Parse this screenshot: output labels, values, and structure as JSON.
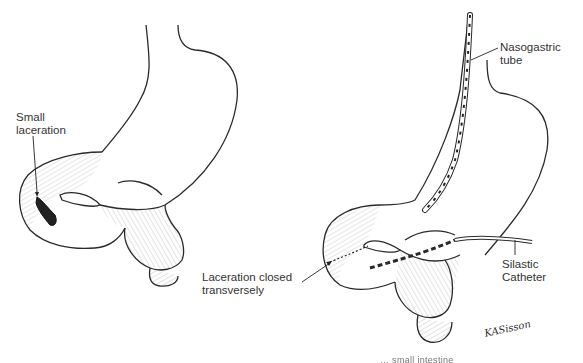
{
  "figure": {
    "type": "medical line illustration",
    "panels": [
      {
        "id": "before",
        "description": "Stomach and duodenum showing small laceration",
        "labels": {
          "laceration": "Small\nlaceration"
        }
      },
      {
        "id": "after",
        "description": "Repair with nasogastric tube and silastic catheter",
        "labels": {
          "nasogastric": "Nasogastric\ntube",
          "closed": "Laceration closed\ntransversely",
          "silastic": "Silastic\nCatheter"
        }
      }
    ],
    "labels_lines": {
      "small_1": "Small",
      "small_2": "laceration",
      "ng_1": "Nasogastric",
      "ng_2": "tube",
      "closed_1": "Laceration closed",
      "closed_2": "transversely",
      "silastic_1": "Silastic",
      "silastic_2": "Catheter"
    },
    "signature": "KASisson",
    "caption_fragment": "… small intestine"
  },
  "colors": {
    "ink": "#2a2a2a",
    "background": "#ffffff"
  }
}
